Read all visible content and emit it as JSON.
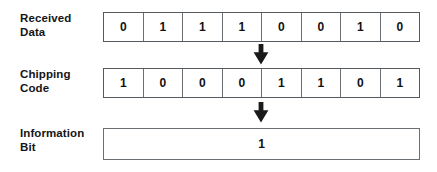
{
  "diagram": {
    "rows": [
      {
        "id": "received-data",
        "label": "Received\nData",
        "bits": [
          "0",
          "1",
          "1",
          "1",
          "0",
          "0",
          "1",
          "0"
        ]
      },
      {
        "id": "chipping-code",
        "label": "Chipping\nCode",
        "bits": [
          "1",
          "0",
          "0",
          "0",
          "1",
          "1",
          "0",
          "1"
        ]
      }
    ],
    "result": {
      "id": "information-bit",
      "label": "Information\nBit",
      "value": "1"
    },
    "arrows": [
      {
        "id": "arrow-received-to-chipping",
        "direction": "down"
      },
      {
        "id": "arrow-chipping-to-information",
        "direction": "down"
      }
    ],
    "colors": {
      "background": "#ffffff",
      "text": "#111111",
      "border": "#6a6f73",
      "arrow": "#1a1a1a"
    }
  }
}
